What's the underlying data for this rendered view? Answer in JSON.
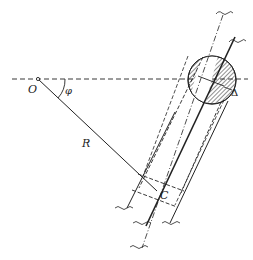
{
  "diagram": {
    "type": "geometric-construction",
    "labels": {
      "origin": "O",
      "angle": "φ",
      "radius": "R",
      "point_c": "C",
      "offset": "Δ"
    },
    "colors": {
      "line": "#222222",
      "background": "#ffffff"
    }
  }
}
